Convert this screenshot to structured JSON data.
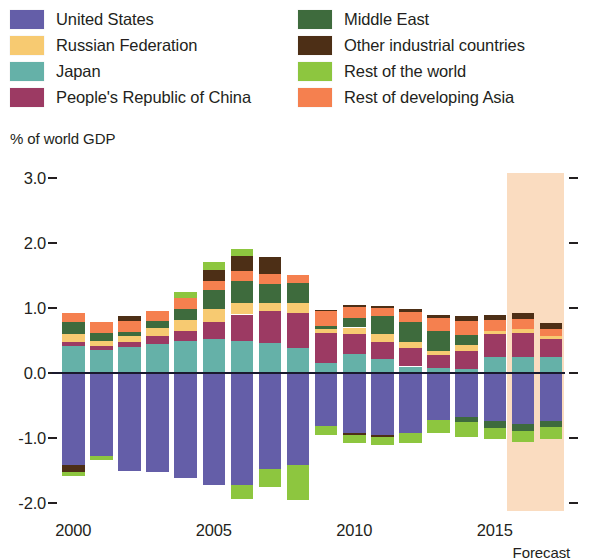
{
  "legend": {
    "left": [
      {
        "label": "United States",
        "color": "#645ea8",
        "key": "us"
      },
      {
        "label": "Russian Federation",
        "color": "#f7ca71",
        "key": "russia"
      },
      {
        "label": "Japan",
        "color": "#65b1a8",
        "key": "japan"
      },
      {
        "label": "People's Republic of China",
        "color": "#9c3a63",
        "key": "prc"
      }
    ],
    "right": [
      {
        "label": "Middle East",
        "color": "#3e6b3d",
        "key": "middle_east"
      },
      {
        "label": "Other industrial countries",
        "color": "#4d2f16",
        "key": "other_industrial"
      },
      {
        "label": "Rest of the world",
        "color": "#8dc63f",
        "key": "rest_world"
      },
      {
        "label": "Rest of developing Asia",
        "color": "#f5804f",
        "key": "rest_asia"
      }
    ]
  },
  "axis_title": "% of world GDP",
  "forecast_note": "Forecast",
  "chart_data": {
    "type": "bar",
    "subtype": "stacked-diverging",
    "title": "",
    "xlabel": "",
    "ylabel": "% of world GDP",
    "ylim": [
      -2.0,
      3.0
    ],
    "yticks": [
      "3.0",
      "2.0",
      "1.0",
      "0.0",
      "-1.0",
      "-2.0"
    ],
    "ytick_values": [
      3.0,
      2.0,
      1.0,
      0.0,
      -1.0,
      -2.0
    ],
    "grid": false,
    "legend_position": "top",
    "x": [
      2000,
      2001,
      2002,
      2003,
      2004,
      2005,
      2006,
      2007,
      2008,
      2009,
      2010,
      2011,
      2012,
      2013,
      2014,
      2015,
      2016,
      2017
    ],
    "xtick_labels": [
      "2000",
      "2005",
      "2010",
      "2015"
    ],
    "xtick_values": [
      2000,
      2005,
      2010,
      2015
    ],
    "forecast_start": 2016,
    "forecast_band_color": "#fadcc0",
    "stack_order_positive": [
      "japan",
      "prc",
      "russia",
      "middle_east",
      "rest_asia",
      "other_industrial",
      "rest_world"
    ],
    "stack_order_negative": [
      "us",
      "other_industrial",
      "rest_world"
    ],
    "series": [
      {
        "name": "United States",
        "key": "us",
        "color": "#645ea8",
        "values": [
          -1.42,
          -1.28,
          -1.5,
          -1.52,
          -1.62,
          -1.72,
          -1.72,
          -1.48,
          -1.42,
          -0.82,
          -0.92,
          -0.95,
          -0.92,
          -0.73,
          -0.68,
          -0.74,
          -0.79,
          -0.74
        ]
      },
      {
        "name": "Japan",
        "key": "japan",
        "color": "#65b1a8",
        "values": [
          0.42,
          0.36,
          0.4,
          0.44,
          0.49,
          0.52,
          0.49,
          0.46,
          0.39,
          0.16,
          0.29,
          0.21,
          0.1,
          0.07,
          0.06,
          0.24,
          0.25,
          0.24
        ]
      },
      {
        "name": "People's Republic of China",
        "key": "prc",
        "color": "#9c3a63",
        "values": [
          0.05,
          0.05,
          0.08,
          0.13,
          0.16,
          0.26,
          0.41,
          0.5,
          0.53,
          0.45,
          0.31,
          0.26,
          0.28,
          0.21,
          0.28,
          0.36,
          0.37,
          0.28
        ]
      },
      {
        "name": "Russian Federation",
        "key": "russia",
        "color": "#f7ca71",
        "values": [
          0.13,
          0.08,
          0.09,
          0.12,
          0.16,
          0.2,
          0.18,
          0.11,
          0.16,
          0.06,
          0.1,
          0.13,
          0.09,
          0.06,
          0.09,
          0.05,
          0.05,
          0.05
        ]
      },
      {
        "name": "Middle East",
        "key": "middle_east",
        "color": "#3e6b3d",
        "values": [
          0.18,
          0.13,
          0.06,
          0.11,
          0.18,
          0.3,
          0.33,
          0.3,
          0.31,
          0.06,
          0.14,
          0.27,
          0.32,
          0.3,
          0.15,
          0.0,
          0.0,
          0.0
        ]
      },
      {
        "name": "Rest of developing Asia",
        "key": "rest_asia",
        "color": "#f5804f",
        "values": [
          0.15,
          0.17,
          0.17,
          0.16,
          0.16,
          0.14,
          0.16,
          0.16,
          0.12,
          0.22,
          0.18,
          0.13,
          0.15,
          0.2,
          0.22,
          0.17,
          0.16,
          0.11
        ]
      },
      {
        "name": "Other industrial countries",
        "key": "other_industrial",
        "color": "#4d2f16",
        "values": [
          0.0,
          0.0,
          0.08,
          0.0,
          0.0,
          0.16,
          0.23,
          0.25,
          0.0,
          0.02,
          0.03,
          0.03,
          0.04,
          0.06,
          0.07,
          0.08,
          0.09,
          0.09
        ]
      },
      {
        "name": "Rest of the world",
        "key": "rest_world",
        "color": "#8dc63f",
        "values": [
          0.0,
          0.0,
          0.0,
          0.0,
          0.1,
          0.13,
          0.11,
          0.0,
          0.0,
          0.0,
          0.0,
          0.0,
          0.0,
          0.0,
          0.0,
          0.0,
          0.0,
          0.0
        ]
      }
    ],
    "negative_segments": [
      {
        "name": "Other industrial countries",
        "key": "other_industrial",
        "color": "#4d2f16",
        "values": [
          -0.1,
          0.0,
          0.0,
          0.0,
          0.0,
          0.0,
          0.0,
          0.0,
          0.0,
          0.0,
          -0.03,
          -0.03,
          0.0,
          0.0,
          0.0,
          0.0,
          0.0,
          0.0
        ]
      },
      {
        "name": "Rest of the world",
        "key": "rest_world",
        "color": "#8dc63f",
        "values": [
          -0.06,
          -0.06,
          0.0,
          0.0,
          0.0,
          0.0,
          -0.22,
          -0.27,
          -0.54,
          -0.14,
          -0.13,
          -0.13,
          -0.15,
          -0.19,
          -0.22,
          -0.18,
          -0.17,
          -0.18
        ]
      },
      {
        "name": "Middle East",
        "key": "middle_east_neg",
        "color": "#3e6b3d",
        "values": [
          0.0,
          0.0,
          0.0,
          0.0,
          0.0,
          0.0,
          0.0,
          0.0,
          0.0,
          0.0,
          0.0,
          0.0,
          0.0,
          0.0,
          -0.08,
          -0.1,
          -0.1,
          -0.09
        ]
      }
    ]
  }
}
